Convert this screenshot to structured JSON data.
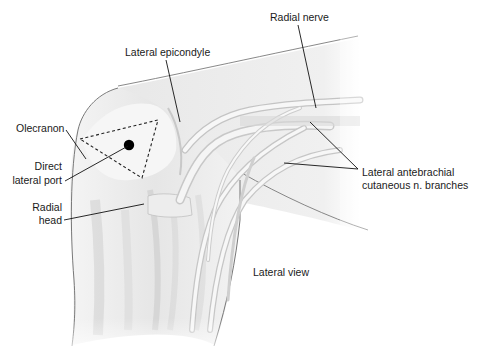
{
  "figure": {
    "view_caption": "Lateral view",
    "labels": {
      "radial_nerve": "Radial nerve",
      "lateral_epicondyle": "Lateral epicondyle",
      "olecranon": "Olecranon",
      "direct_lateral_port_line1": "Direct",
      "direct_lateral_port_line2": "lateral port",
      "radial_head_line1": "Radial",
      "radial_head_line2": "head",
      "lacn_line1": "Lateral antebrachial",
      "lacn_line2": "cutaneous n. branches"
    },
    "colors": {
      "background": "#ffffff",
      "skin_fill": "#ececec",
      "outline": "#6a6a6a",
      "leader": "#111111",
      "port_marker": "#000000"
    }
  }
}
